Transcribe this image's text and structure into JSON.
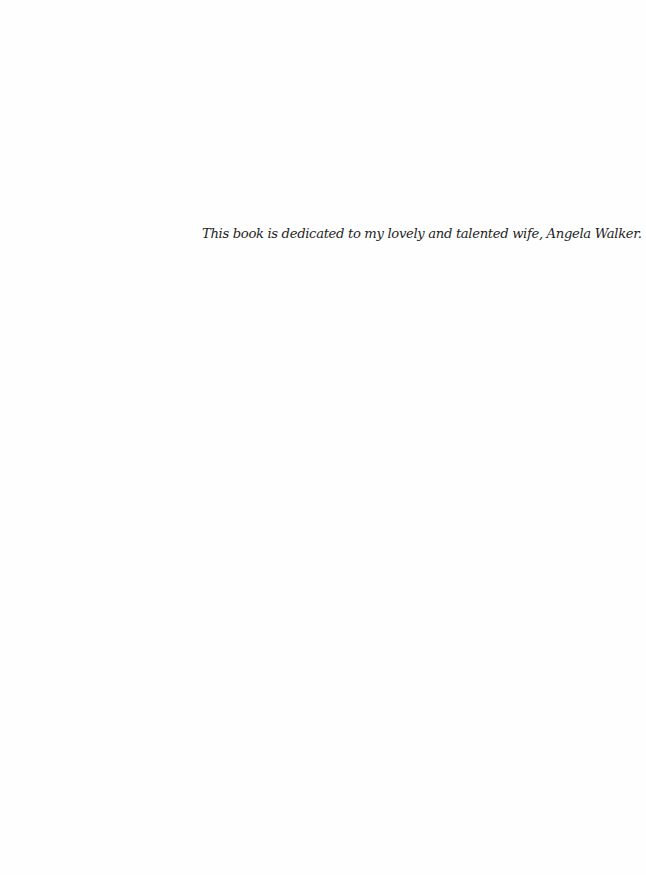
{
  "page": {
    "dedication": "This book is dedicated to my lovely and talented wife, Angela Walker."
  }
}
